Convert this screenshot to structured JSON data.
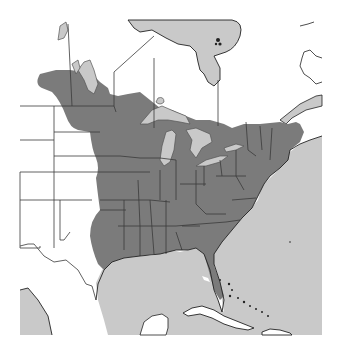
{
  "map": {
    "title": "Species range map – Eastern North America",
    "type": "range map",
    "region": "Eastern United States and southern Canada",
    "colors": {
      "land": "#ffffff",
      "water": "#c9c9c9",
      "range": "#7b7b7b",
      "border": "#3a3a3a"
    },
    "legend": {
      "range_label": "Shaded area: species range"
    },
    "features": [
      "Hudson Bay",
      "James Bay",
      "Lake Winnipeg",
      "Great Lakes",
      "Gulf of Mexico",
      "Atlantic Ocean",
      "Florida",
      "Cuba",
      "Bahamas",
      "Yucatan Peninsula",
      "Gulf of St. Lawrence"
    ]
  }
}
